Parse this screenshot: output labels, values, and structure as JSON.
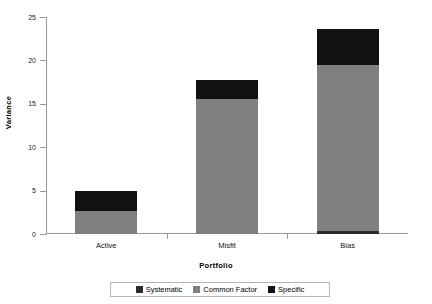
{
  "chart_data": {
    "type": "bar",
    "stacked": true,
    "title": "",
    "xlabel": "Portfolio",
    "ylabel": "Variance",
    "categories": [
      "Active",
      "Misfit",
      "Bias"
    ],
    "series": [
      {
        "name": "Systematic",
        "color": "#2b2b2b",
        "values": [
          0.0,
          0.0,
          0.35
        ]
      },
      {
        "name": "Common Factor",
        "color": "#808080",
        "values": [
          2.65,
          15.55,
          19.1
        ]
      },
      {
        "name": "Specific",
        "color": "#111111",
        "values": [
          2.3,
          2.15,
          4.2
        ]
      }
    ],
    "totals": [
      4.95,
      17.7,
      23.65
    ],
    "ylim": [
      0,
      25
    ],
    "yticks": [
      0,
      5,
      10,
      15,
      20,
      25
    ],
    "ytick_labels": [
      "0",
      "5",
      "10",
      "15",
      "20",
      "25"
    ],
    "grid": false,
    "legend_position": "bottom"
  },
  "legend": {
    "items": [
      {
        "label": "Systematic",
        "color": "#2b2b2b"
      },
      {
        "label": "Common Factor",
        "color": "#808080"
      },
      {
        "label": "Specific",
        "color": "#111111"
      }
    ]
  },
  "axis": {
    "y_title": "Variance",
    "x_title": "Portfolio"
  }
}
